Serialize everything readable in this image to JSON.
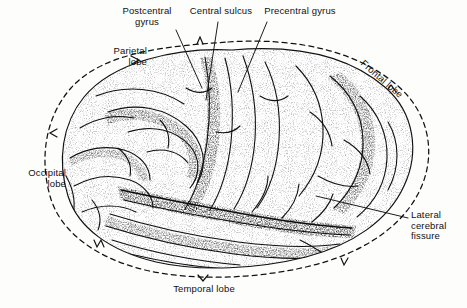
{
  "figure": {
    "style": "stippled pen-and-ink anatomical illustration",
    "background_color": "#fdfdfc",
    "ink_color": "#111111"
  },
  "labels": {
    "postcentral_gyrus": "Postcentral\ngyrus",
    "central_sulcus": "Central sulcus",
    "precentral_gyrus": "Precentral gyrus",
    "parietal_lobe": "Parietal\nlobe",
    "frontal_lobe": "Frontal lobe",
    "occipital_lobe": "Occipital\nlobe",
    "temporal_lobe": "Temporal lobe",
    "lateral_cerebral_fissure": "Lateral\ncerebral\nfissure"
  }
}
